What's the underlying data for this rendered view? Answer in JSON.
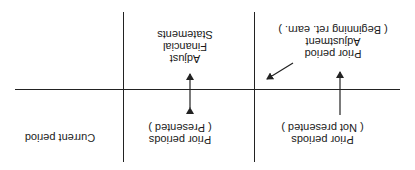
{
  "diagram": {
    "orientation": "rotated-180",
    "labels": {
      "current_period": "Current period",
      "prior_presented": [
        "Prior periods",
        "( Presented )"
      ],
      "prior_not_presented": [
        "Prior periods",
        "( Not presented )"
      ],
      "adjust_fs": [
        "Adjust",
        "Financial",
        "Statements"
      ],
      "ppa": [
        "Prior period",
        "Adjustment",
        "( Beginning ret. earn. )"
      ]
    },
    "colors": {
      "line": "#222222",
      "text": "#1a1a1a",
      "background": "#ffffff"
    }
  }
}
